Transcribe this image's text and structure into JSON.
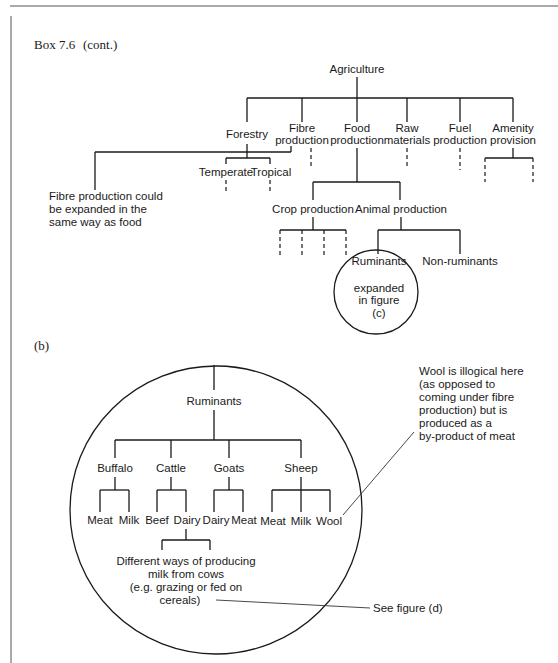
{
  "header": {
    "box_title": "Box 7.6",
    "box_cont": "(cont.)"
  },
  "figure_a": {
    "root": "Agriculture",
    "branches": {
      "forestry": "Forestry",
      "fibre_1": "Fibre",
      "fibre_2": "production",
      "food_1": "Food",
      "food_2": "production",
      "raw_1": "Raw",
      "raw_2": "materials",
      "fuel_1": "Fuel",
      "fuel_2": "production",
      "amenity_1": "Amenity",
      "amenity_2": "provision"
    },
    "forestry_children": {
      "temperate": "Temperate",
      "tropical": "Tropical"
    },
    "food_children": {
      "crop": "Crop production",
      "animal": "Animal production"
    },
    "animal_children": {
      "ruminants": "Ruminants",
      "non_ruminants": "Non-ruminants"
    },
    "circle_note": [
      "expanded",
      "in figure",
      "(c)"
    ],
    "fibre_note": [
      "Fibre production could",
      "be expanded in the",
      "same way as food"
    ]
  },
  "figure_b": {
    "label": "(b)",
    "root": "Ruminants",
    "species": {
      "buffalo": "Buffalo",
      "cattle": "Cattle",
      "goats": "Goats",
      "sheep": "Sheep"
    },
    "products": {
      "buffalo_meat": "Meat",
      "buffalo_milk": "Milk",
      "cattle_beef": "Beef",
      "cattle_dairy": "Dairy",
      "goats_dairy": "Dairy",
      "goats_meat": "Meat",
      "sheep_meat": "Meat",
      "sheep_milk": "Milk",
      "sheep_wool": "Wool"
    },
    "dairy_note": [
      "Different ways of producing",
      "milk from cows",
      "(e.g. grazing or fed on",
      "cereals)"
    ],
    "wool_note": [
      "Wool is illogical here",
      "(as opposed to",
      "coming under fibre",
      "production) but is",
      "produced as a",
      "by-product of meat"
    ],
    "see_figure": "See figure (d)"
  }
}
